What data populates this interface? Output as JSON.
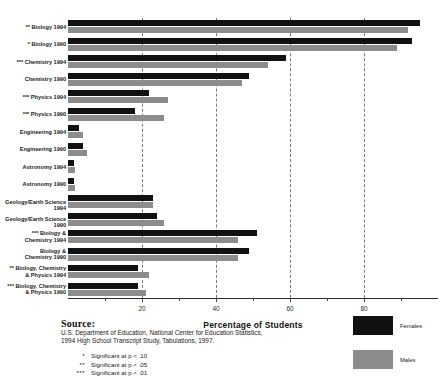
{
  "chart_data": {
    "type": "bar",
    "orientation": "horizontal",
    "title": "",
    "xlabel": "Percentage of Students",
    "ylabel": "",
    "xlim": [
      0,
      100
    ],
    "xticks": [
      20,
      40,
      60,
      80
    ],
    "xtick_labels": [
      "20",
      "40",
      "60",
      "80"
    ],
    "grid": true,
    "grid_style": "dashed vertical",
    "legend_position": "bottom-right",
    "categories": [
      "Biology 1994",
      "Biology 1990",
      "Chemistry 1994",
      "Chemistry 1990",
      "Physics 1994",
      "Physics 1990",
      "Engineering 1994",
      "Engineering 1990",
      "Astronomy 1994",
      "Astronomy 1990",
      "Geology/Earth Science 1994",
      "Geology/Earth Science 1990",
      "Biology &\nChemistry 1994",
      "Biology &\nChemistry 1990",
      "Biology, Chemistry\n& Physics 1994",
      "Biology, Chemistry\n& Physics 1990"
    ],
    "significance_marks": [
      "**",
      "*",
      "***",
      "",
      "***",
      "***",
      "",
      "",
      "",
      "",
      "",
      "",
      "***",
      "",
      "**",
      "***"
    ],
    "series": [
      {
        "name": "Females",
        "color": "#111111",
        "values": [
          95,
          93,
          59,
          49,
          22,
          18,
          3,
          4,
          1.5,
          1.5,
          23,
          24,
          51,
          49,
          19,
          19
        ]
      },
      {
        "name": "Males",
        "color": "#8c8c8c",
        "values": [
          92,
          89,
          54,
          47,
          27,
          26,
          4,
          5,
          2,
          2,
          23,
          26,
          46,
          46,
          22,
          21
        ]
      }
    ]
  },
  "axis": {
    "x_title": "Percentage of Students"
  },
  "legend": {
    "items": [
      {
        "label": "Females",
        "color": "#111111"
      },
      {
        "label": "Males",
        "color": "#8c8c8c"
      }
    ]
  },
  "source": {
    "heading": "Source:",
    "line1": "U.S. Department of Education, National Center for Education Statistics,",
    "line2": "1994 High School Transcript Study, Tabulations, 1997."
  },
  "notes": [
    {
      "mark": "*",
      "text": "Significant at p < .10"
    },
    {
      "mark": "**",
      "text": "Significant at p < .05"
    },
    {
      "mark": "***",
      "text": "Significant at p < .01"
    }
  ]
}
